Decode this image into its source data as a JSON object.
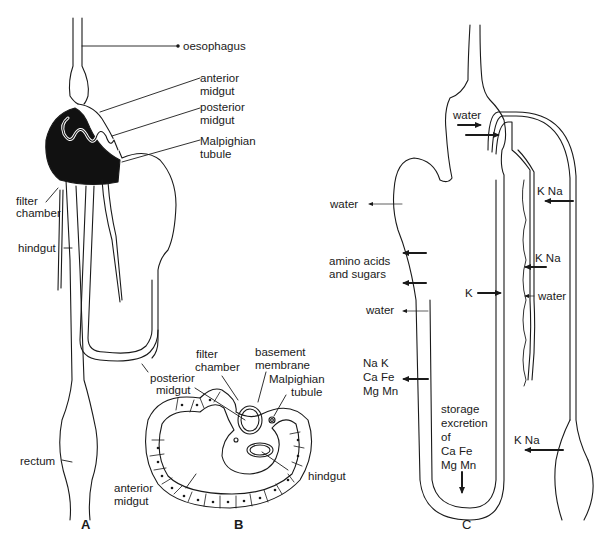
{
  "diagram": {
    "panels": [
      {
        "id": "A",
        "label": "A"
      },
      {
        "id": "B",
        "label": "B"
      },
      {
        "id": "C",
        "label": "C"
      }
    ],
    "panel_A": {
      "labels": {
        "oesophagus": "oesophagus",
        "anterior_midgut_1": "anterior",
        "anterior_midgut_2": "midgut",
        "posterior_midgut_1": "posterior",
        "posterior_midgut_2": "midgut",
        "malpighian_1": "Malpighian",
        "malpighian_2": "tubule",
        "filter_chamber_1": "filter",
        "filter_chamber_2": "chamber",
        "hindgut": "hindgut",
        "posterior_midgut_low_1": "posterior",
        "posterior_midgut_low_2": "midgut",
        "rectum": "rectum"
      }
    },
    "panel_B": {
      "labels": {
        "filter_chamber_1": "filter",
        "filter_chamber_2": "chamber",
        "basement_membrane_1": "basement",
        "basement_membrane_2": "membrane",
        "malpighian_1": "Malpighian",
        "malpighian_2": "tubule",
        "hindgut": "hindgut",
        "anterior_midgut_1": "anterior",
        "anterior_midgut_2": "midgut"
      }
    },
    "panel_C": {
      "labels": {
        "water_top": "water",
        "water_left": "water",
        "amino_1": "amino acids",
        "amino_2": "and sugars",
        "water_mid": "water",
        "ions_1": "Na K",
        "ions_2": "Ca Fe",
        "ions_3": "Mg Mn",
        "storage_1": "storage",
        "storage_2": "excretion",
        "storage_3": "of",
        "storage_4": "Ca Fe",
        "storage_5": "Mg Mn",
        "k_na_1": "K Na",
        "k_na_2": "K Na",
        "k": "K",
        "water_right": "water",
        "k_na_3": "K Na"
      }
    }
  }
}
